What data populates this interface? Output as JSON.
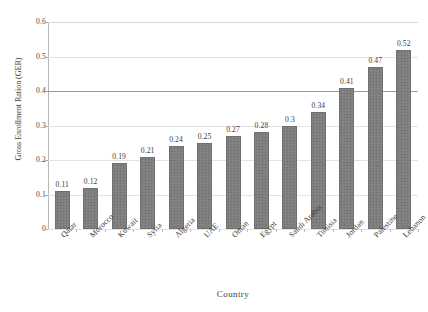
{
  "chart_data": {
    "type": "bar",
    "title": "",
    "xlabel": "Country",
    "ylabel": "Gross Enrollment Ration (GER)",
    "categories": [
      "Qatar",
      "Morocco",
      "Kuwait",
      "Syria",
      "Algeria",
      "UAE",
      "Oman",
      "Egypt",
      "Saudi Arabia",
      "Tunisia",
      "Jordan",
      "Palestine",
      "Lebanon"
    ],
    "values": [
      0.11,
      0.12,
      0.19,
      0.21,
      0.24,
      0.25,
      0.27,
      0.28,
      0.3,
      0.34,
      0.41,
      0.47,
      0.52
    ],
    "value_labels": [
      "0.11",
      "0.12",
      "0.19",
      "0.21",
      "0.24",
      "0.25",
      "0.27",
      "0.28",
      "0.3",
      "0.34",
      "0.41",
      "0.47",
      "0.52"
    ],
    "ylim": [
      0,
      0.6
    ],
    "ytick_labels": [
      "0",
      "0.1",
      "0.2",
      "0.3",
      "0.4",
      "0.5",
      "0.6"
    ],
    "ytick_values": [
      0,
      0.1,
      0.2,
      0.3,
      0.4,
      0.5,
      0.6
    ],
    "grid": true,
    "grid_axis": "y",
    "legend": false,
    "bar_color": "#7e7e7e",
    "bar_pattern": "fine-dotted",
    "series": [
      {
        "name": "Gross Enrollment Ration (GER)",
        "values": [
          0.11,
          0.12,
          0.19,
          0.21,
          0.24,
          0.25,
          0.27,
          0.28,
          0.3,
          0.34,
          0.41,
          0.47,
          0.52
        ]
      }
    ]
  }
}
